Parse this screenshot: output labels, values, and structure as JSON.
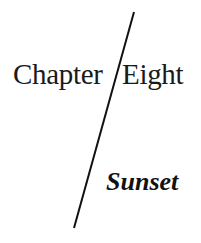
{
  "chapter_heading": {
    "label_word": "Chapter",
    "number_word": "Eight",
    "title": "Sunset"
  },
  "colors": {
    "text": "#1a1a1a",
    "line": "#111111",
    "background": "#ffffff"
  }
}
